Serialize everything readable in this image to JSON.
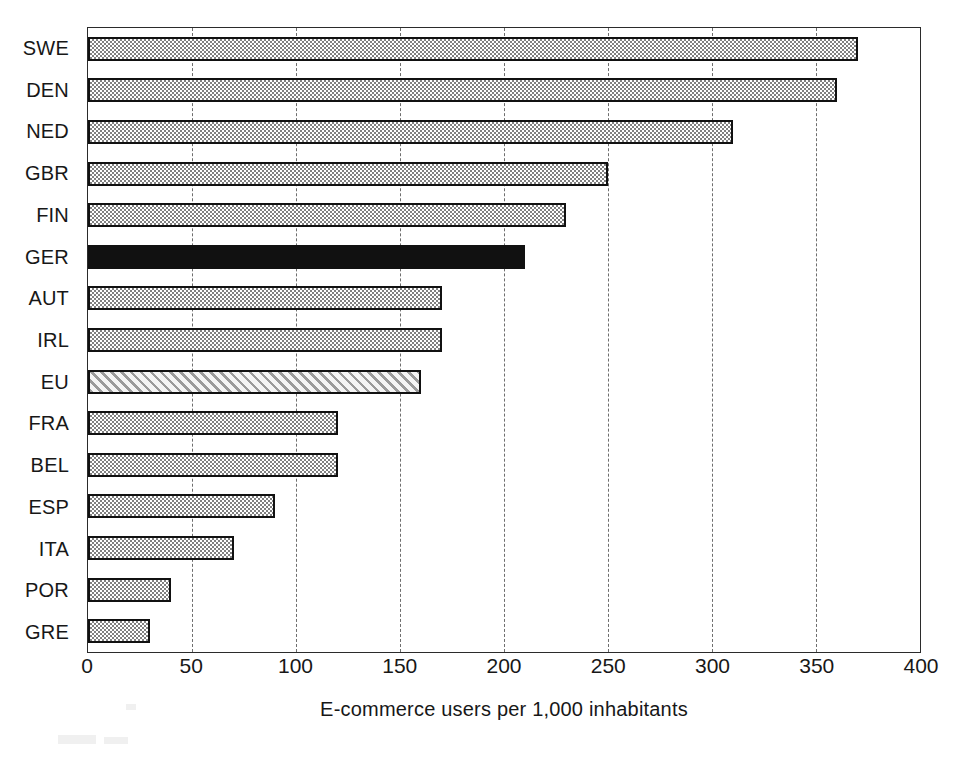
{
  "chart_data": {
    "type": "bar",
    "orientation": "horizontal",
    "title": "",
    "xlabel": "E-commerce users per 1,000 inhabitants",
    "ylabel": "",
    "xlim": [
      0,
      400
    ],
    "xticks": [
      0,
      50,
      100,
      150,
      200,
      250,
      300,
      350,
      400
    ],
    "grid": "vertical-dashed",
    "legend": "none",
    "categories": [
      "SWE",
      "DEN",
      "NED",
      "GBR",
      "FIN",
      "GER",
      "AUT",
      "IRL",
      "EU",
      "FRA",
      "BEL",
      "ESP",
      "ITA",
      "POR",
      "GRE"
    ],
    "values": [
      370,
      360,
      310,
      250,
      230,
      210,
      170,
      170,
      160,
      120,
      120,
      90,
      70,
      40,
      30
    ],
    "bar_styles": [
      "dither",
      "dither",
      "dither",
      "dither",
      "dither",
      "solid-black",
      "dither",
      "dither",
      "hatch",
      "dither",
      "dither",
      "dither",
      "dither",
      "dither",
      "dither"
    ],
    "highlight": {
      "GER": "solid-black",
      "EU": "hatch"
    }
  },
  "axis": {
    "x_tick_labels": [
      "0",
      "50",
      "100",
      "150",
      "200",
      "250",
      "300",
      "350",
      "400"
    ],
    "x_title": "E-commerce users per 1,000 inhabitants"
  },
  "colors": {
    "bar_fill_gray": "#808080",
    "bar_border": "#111111",
    "bar_solid": "#111111",
    "bar_hatch_bg": "#f2f2f2",
    "bar_hatch_line": "#9a9a9a",
    "gridline": "#555555",
    "plot_border": "#2b2b2b",
    "text": "#171717",
    "background": "#ffffff"
  }
}
